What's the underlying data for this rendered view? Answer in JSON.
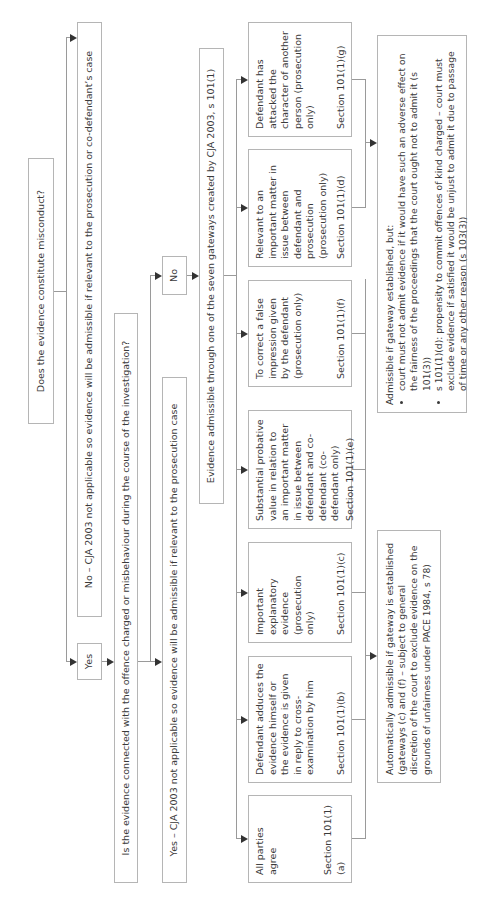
{
  "title": "Bad character of the defendant",
  "nodes": {
    "misconduct_question": "Does the evidence constitute misconduct?",
    "no_cja_outcome": "No – CJA 2003 not applicable so evidence will be admissible if relevant to the prosecution or co-defendant’s case",
    "yes_label_1": "Yes",
    "connected_question": "Is the evidence connected with the offence charged or misbehaviour during the course of the investigation?",
    "no_label_2": "No",
    "yes_cja_outcome": "Yes  – CJA 2003 not applicable so evidence will be admissible if relevant to the prosecution case",
    "gateways_heading": "Evidence admissible through one of the seven gateways created by CJA 2003, s 101(1)"
  },
  "gateways": [
    {
      "id": "a",
      "description": "All parties agree",
      "section": "Section 101(1)(a)"
    },
    {
      "id": "b",
      "description": "Defendant adduces the evidence himself or the evidence is given in reply to cross-examination by him",
      "section": "Section 101(1)(b)"
    },
    {
      "id": "c",
      "description": "Important explanatory evidence (prosecution only)",
      "section": "Section 101(1)(c)"
    },
    {
      "id": "e",
      "description": "Substantial probative value in relation to an important matter in issue between defendant and co-defendant (co-defendant only)",
      "section": "Section 101(1)(e)"
    },
    {
      "id": "f",
      "description": "To correct a false impression given by the defendant (prosecution only)",
      "section": "Section 101(1)(f)"
    },
    {
      "id": "d",
      "description": "Relevant to an important matter in issue between defendant and prosecution (prosecution only)",
      "section": "Section 101(1)(d)"
    },
    {
      "id": "g",
      "description": "Defendant has attacked the character of another person (prosecution only)",
      "section": "Section 101(1)(g)"
    }
  ],
  "outcomes": {
    "automatic": "Automatically admissible if gateway is established (gateways (c) and (f) – subject to general discretion of the court to exclude evidence on the grounds of unfairness under PACE 1984, s 78)",
    "conditional_intro": "Admissible if gateway established, but:",
    "conditional_bullets": [
      "court must not admit evidence if it would have such an adverse effect on the fairness of the proceedings that the court ought not to admit it (s 101(3))",
      "s 101(1)(d): propensity to commit offences of kind charged – court must exclude evidence if satisfied it would be unjust to admit it due to passage of time or any other reason (s 103(3))"
    ]
  },
  "colors": {
    "border": "#b5b5b5",
    "line": "#9a9a9a",
    "arrow": "#333333",
    "text": "#3a3a3a"
  }
}
